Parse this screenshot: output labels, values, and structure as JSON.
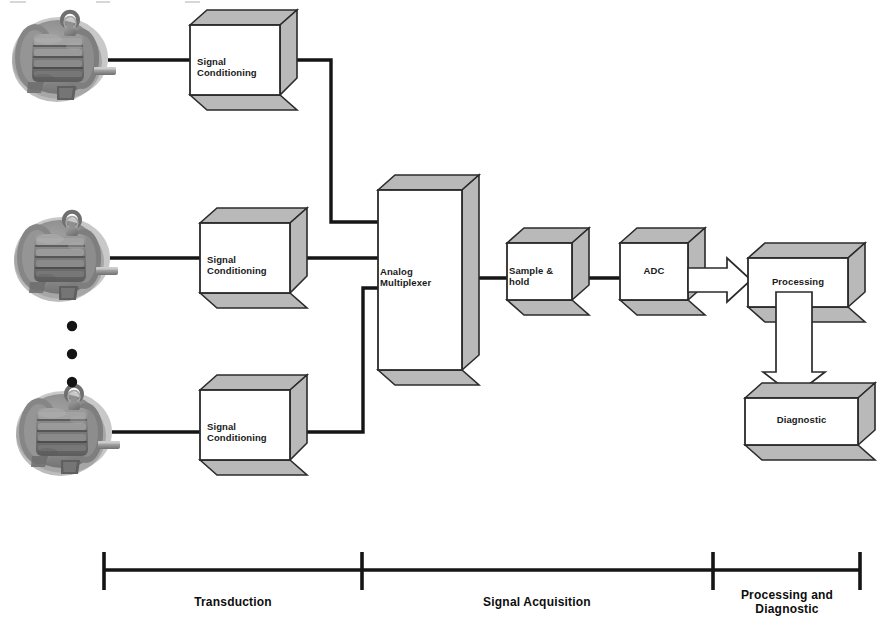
{
  "diagram": {
    "colors": {
      "line": "#151515",
      "box_front": "#ffffff",
      "box_side": "#b9b9b9",
      "box_stroke": "#2b2b2b",
      "arrow_fill": "#ffffff",
      "arrow_stroke": "#2b2b2b",
      "text": "#111111",
      "motor_gray": "#8c8c8c"
    },
    "blocks": [
      {
        "id": "sc1",
        "name": "signal-conditioning-top",
        "label": "Signal\nConditioning",
        "align": "left"
      },
      {
        "id": "sc2",
        "name": "signal-conditioning-middle",
        "label": "Signal\nConditioning",
        "align": "left"
      },
      {
        "id": "sc3",
        "name": "signal-conditioning-bottom",
        "label": "Signal\nConditioning",
        "align": "left"
      },
      {
        "id": "mux",
        "name": "analog-multiplexer",
        "label": "Analog Multiplexer",
        "align": "left"
      },
      {
        "id": "sh",
        "name": "sample-and-hold",
        "label": "Sample & hold",
        "align": "left"
      },
      {
        "id": "adc",
        "name": "adc",
        "label": "ADC",
        "align": "center"
      },
      {
        "id": "proc",
        "name": "processing",
        "label": "Processing",
        "align": "center"
      },
      {
        "id": "diag",
        "name": "diagnostic",
        "label": "Diagnostic",
        "align": "center"
      }
    ],
    "sources": [
      {
        "id": "motor1",
        "name": "electric-motor-top",
        "label": "electric motor"
      },
      {
        "id": "motor2",
        "name": "electric-motor-middle",
        "label": "electric motor"
      },
      {
        "id": "motor3",
        "name": "electric-motor-bottom",
        "label": "electric motor"
      }
    ],
    "ellipsis": {
      "name": "vertical-ellipsis",
      "dots": 3
    },
    "stages": [
      {
        "id": "stage1",
        "name": "stage-transduction",
        "label": "Transduction"
      },
      {
        "id": "stage2",
        "name": "stage-signal-acquisition",
        "label": "Signal Acquisition"
      },
      {
        "id": "stage3",
        "name": "stage-processing-diagnostic",
        "label": "Processing and\nDiagnostic"
      }
    ]
  }
}
